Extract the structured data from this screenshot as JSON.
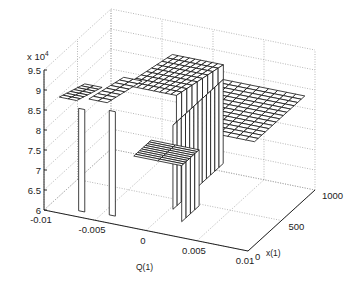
{
  "chart_data": {
    "type": "surface3d",
    "title": "",
    "xlabel": "Q(1)",
    "ylabel": "x(1)",
    "zlabel": "",
    "z_multiplier": "x 10",
    "z_multiplier_exp": "4",
    "q_ticks": [
      "-0.01",
      "-0.005",
      "0",
      "0.005",
      "0.01"
    ],
    "x_ticks": [
      "0",
      "500",
      "1000"
    ],
    "z_ticks": [
      "6",
      "6.5",
      "7",
      "7.5",
      "8",
      "8.5",
      "9",
      "9.5"
    ],
    "q_range": [
      -0.01,
      0.01
    ],
    "x_range": [
      0,
      1000
    ],
    "z_range": [
      60000,
      95000
    ],
    "grid": true,
    "series": [
      {
        "name": "strip-left",
        "q": [
          -0.0085,
          -0.0065
        ],
        "x": [
          0,
          350
        ],
        "z": [
          89000,
          86500
        ]
      },
      {
        "name": "strip-mid",
        "q": [
          -0.0055,
          -0.0035
        ],
        "x": [
          0,
          500
        ],
        "z": [
          90000,
          87500
        ]
      },
      {
        "name": "block-upper",
        "q": [
          -0.003,
          0.002
        ],
        "x": [
          150,
          800
        ],
        "z": [
          92500,
          89000
        ]
      },
      {
        "name": "strip-low-front",
        "q": [
          -0.001,
          0.004
        ],
        "x": [
          0,
          250
        ],
        "z": [
          78000,
          78000
        ]
      },
      {
        "name": "plateau-right",
        "q": [
          0.001,
          0.009
        ],
        "x": [
          300,
          1000
        ],
        "z": [
          83000,
          83000
        ]
      },
      {
        "name": "drops",
        "z_min": 61000
      }
    ]
  }
}
